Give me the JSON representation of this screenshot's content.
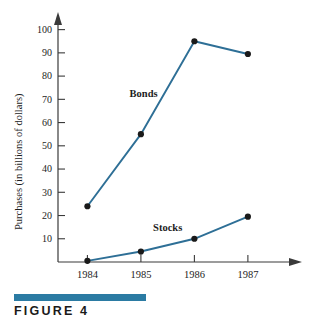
{
  "figure": {
    "caption": "FIGURE 4",
    "bar_color": "#2b7ba3"
  },
  "chart_data": {
    "type": "line",
    "title": "",
    "xlabel": "",
    "ylabel": "Purchases (in billions of dollars)",
    "categories": [
      "1984",
      "1985",
      "1986",
      "1987"
    ],
    "x": [
      1984,
      1985,
      1986,
      1987
    ],
    "series": [
      {
        "name": "Bonds",
        "values": [
          24,
          55,
          95,
          89.5
        ],
        "color": "#2e6f96",
        "label_text": "Bonds"
      },
      {
        "name": "Stocks",
        "values": [
          0.5,
          4.5,
          10,
          19.5
        ],
        "color": "#2e6f96",
        "label_text": "Stocks"
      }
    ],
    "ylim": [
      0,
      105
    ],
    "xlim": [
      1983.45,
      1987.75
    ],
    "yticks": [
      10,
      20,
      30,
      40,
      50,
      60,
      70,
      80,
      90,
      100
    ],
    "ytick_labels": [
      "10",
      "20",
      "30",
      "40",
      "50",
      "60",
      "70",
      "80",
      "90",
      "100"
    ],
    "xticks": [
      1984,
      1985,
      1986,
      1987
    ],
    "xtick_labels": [
      "1984",
      "1985",
      "1986",
      "1987"
    ],
    "grid": false,
    "legend": "inline-annotations",
    "annotations": [
      {
        "text": "Bonds",
        "x": 1985.05,
        "y": 71
      },
      {
        "text": "Stocks",
        "x": 1985.5,
        "y": 13.5
      }
    ]
  }
}
